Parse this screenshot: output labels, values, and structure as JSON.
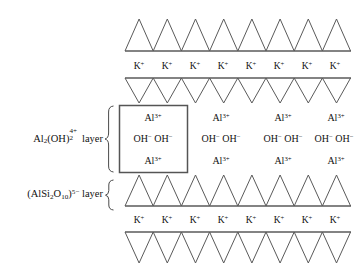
{
  "figure": {
    "stroke_color": "#5a5a5a",
    "box_stroke_color": "#555555",
    "text_color": "#111111",
    "background": "#ffffff"
  },
  "labels": {
    "aluminum_layer": {
      "formula_base": "Al",
      "formula_sub1": "2",
      "formula_mid": "(OH)",
      "formula_sub2": "2",
      "formula_charge": "4+",
      "suffix": "layer",
      "full_text": "Al2(OH)2 4+ layer"
    },
    "silicate_layer": {
      "formula_open": "(AlSi",
      "formula_sub1": "2",
      "formula_mid": "O",
      "formula_sub2": "10",
      "formula_close": ")",
      "formula_charge": "5−",
      "suffix": "layer",
      "full_text": "(AlSi2O10)5− layer"
    }
  },
  "rows": [
    {
      "id": "tetrahedral-top",
      "kind": "triangles-up",
      "count": 8,
      "baseline": "bottom"
    },
    {
      "id": "potassium-row-top",
      "kind": "ion-row",
      "ion": "K",
      "charge": "+",
      "count": 8
    },
    {
      "id": "tetrahedral-upper-inverted",
      "kind": "triangles-down",
      "count": 8,
      "baseline": "top"
    },
    {
      "id": "octahedral-ion-layer",
      "kind": "ion-groups",
      "count": 4,
      "boxed_index": 0
    },
    {
      "id": "tetrahedral-lower",
      "kind": "triangles-up",
      "count": 8,
      "baseline": "bottom"
    },
    {
      "id": "potassium-row-bottom",
      "kind": "ion-row",
      "ion": "K",
      "charge": "+",
      "count": 8
    },
    {
      "id": "tetrahedral-bottom-inverted",
      "kind": "triangles-down",
      "count": 8,
      "baseline": "top"
    }
  ],
  "ion_group": {
    "cation": "Al",
    "cation_charge": "3+",
    "anion": "OH",
    "anion_charge": "−",
    "row1": "Al3+",
    "row2": "OH− OH−",
    "row3": "Al3+"
  },
  "potassium": {
    "symbol": "K",
    "charge": "+"
  },
  "counts": {
    "k_ions_top": 8,
    "k_ions_bottom": 8,
    "ion_groups": 4,
    "triangles_per_row": 8,
    "triangle_rows": 4
  }
}
